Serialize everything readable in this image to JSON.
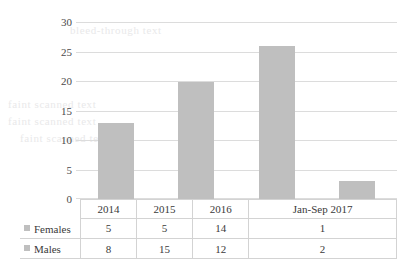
{
  "chart_data": {
    "type": "bar",
    "title": "",
    "subtitle": "",
    "xlabel": "",
    "ylabel": "",
    "categories": [
      "2014",
      "2015",
      "2016",
      "Jan-Sep 2017"
    ],
    "values": [
      13,
      20,
      26,
      3
    ],
    "ylim": [
      0,
      30
    ],
    "yticks": [
      0,
      5,
      10,
      15,
      20,
      25,
      30
    ],
    "grid": true,
    "legend_position": "data-table",
    "bar_color": "#bfbfbf",
    "gridline_color": "#dcdcdc",
    "series": [
      {
        "name": "Females",
        "values": [
          5,
          5,
          14,
          1
        ]
      },
      {
        "name": "Males",
        "values": [
          8,
          15,
          12,
          2
        ]
      }
    ],
    "note": "Bar heights equal the total of Females + Males per category"
  },
  "data_table": {
    "category_header": "",
    "categories": [
      "2014",
      "2015",
      "2016",
      "Jan-Sep 2017"
    ],
    "rows": [
      {
        "label": "Females",
        "marker": "legend-swatch",
        "values": [
          "5",
          "5",
          "14",
          "1"
        ]
      },
      {
        "label": "Males",
        "marker": "legend-swatch",
        "values": [
          "8",
          "15",
          "12",
          "2"
        ]
      }
    ]
  },
  "axis": {
    "y_tick_labels": [
      "30",
      "25",
      "20",
      "15",
      "10",
      "5",
      "0"
    ]
  },
  "background_artifacts": {
    "line1": "bleed-through text",
    "line2": "faint scanned text",
    "line3": "faint scanned text",
    "line4": "faint scanned text"
  }
}
